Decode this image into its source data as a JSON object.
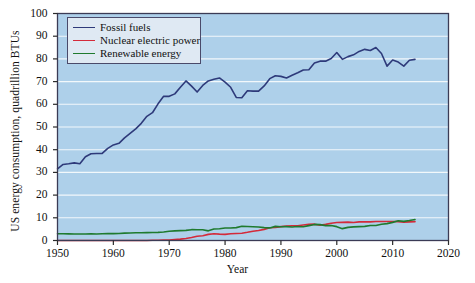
{
  "chart_data": {
    "type": "line",
    "title": "",
    "xlabel": "Year",
    "ylabel": "US energy consumption, quadrillion BTUs",
    "xlim": [
      1950,
      2020
    ],
    "ylim": [
      0,
      100
    ],
    "xticks": [
      1950,
      1960,
      1970,
      1980,
      1990,
      2000,
      2010,
      2020
    ],
    "yticks": [
      0,
      10,
      20,
      30,
      40,
      50,
      60,
      70,
      80,
      90,
      100
    ],
    "grid": "horizontal-white",
    "legend_position": "upper-left-inside",
    "plot_background": "#aed0ea",
    "x": [
      1950,
      1951,
      1952,
      1953,
      1954,
      1955,
      1956,
      1957,
      1958,
      1959,
      1960,
      1961,
      1962,
      1963,
      1964,
      1965,
      1966,
      1967,
      1968,
      1969,
      1970,
      1971,
      1972,
      1973,
      1974,
      1975,
      1976,
      1977,
      1978,
      1979,
      1980,
      1981,
      1982,
      1983,
      1984,
      1985,
      1986,
      1987,
      1988,
      1989,
      1990,
      1991,
      1992,
      1993,
      1994,
      1995,
      1996,
      1997,
      1998,
      1999,
      2000,
      2001,
      2002,
      2003,
      2004,
      2005,
      2006,
      2007,
      2008,
      2009,
      2010,
      2011,
      2012,
      2013,
      2014
    ],
    "series": [
      {
        "name": "Fossil fuels",
        "color": "#2e3a7a",
        "values": [
          31.6,
          33.5,
          33.8,
          34.2,
          33.8,
          36.9,
          38.2,
          38.3,
          38.4,
          40.6,
          42.1,
          42.8,
          45.2,
          47.2,
          49.2,
          51.6,
          54.7,
          56.3,
          60.2,
          63.5,
          63.5,
          64.6,
          67.5,
          70.3,
          68.0,
          65.4,
          68.3,
          70.3,
          71.0,
          71.6,
          69.8,
          67.5,
          63.0,
          62.9,
          66.0,
          65.8,
          65.8,
          68.1,
          71.3,
          72.6,
          72.3,
          71.6,
          72.8,
          73.9,
          75.1,
          75.2,
          78.2,
          79.0,
          79.0,
          80.2,
          82.8,
          79.8,
          81.0,
          81.8,
          83.3,
          84.2,
          83.7,
          85.0,
          82.4,
          76.8,
          79.5,
          78.6,
          76.8,
          79.4,
          79.8
        ]
      },
      {
        "name": "Nuclear electric power",
        "color": "#d42a3a",
        "values": [
          0.0,
          0.0,
          0.0,
          0.0,
          0.0,
          0.0,
          0.0,
          0.0,
          0.0,
          0.0,
          0.0,
          0.0,
          0.0,
          0.0,
          0.0,
          0.0,
          0.0,
          0.1,
          0.1,
          0.2,
          0.2,
          0.4,
          0.6,
          0.9,
          1.3,
          1.9,
          2.1,
          2.7,
          3.0,
          2.8,
          2.7,
          3.0,
          3.1,
          3.2,
          3.6,
          4.1,
          4.4,
          4.9,
          5.6,
          5.7,
          6.1,
          6.4,
          6.5,
          6.5,
          6.8,
          7.1,
          7.2,
          6.7,
          7.1,
          7.6,
          7.9,
          8.0,
          8.1,
          7.9,
          8.2,
          8.2,
          8.2,
          8.4,
          8.4,
          8.4,
          8.4,
          8.3,
          8.1,
          8.2,
          8.3
        ]
      },
      {
        "name": "Renewable energy",
        "color": "#1f7a2e",
        "values": [
          2.98,
          2.95,
          2.9,
          2.88,
          2.85,
          2.88,
          2.95,
          2.88,
          3.0,
          3.05,
          3.02,
          3.1,
          3.25,
          3.3,
          3.4,
          3.4,
          3.45,
          3.55,
          3.6,
          3.75,
          4.08,
          4.25,
          4.35,
          4.45,
          4.77,
          4.72,
          4.75,
          4.25,
          5.04,
          5.17,
          5.49,
          5.48,
          5.68,
          6.27,
          6.15,
          6.03,
          5.94,
          5.67,
          5.55,
          6.22,
          6.04,
          6.12,
          5.92,
          6.16,
          6.07,
          6.56,
          7.09,
          6.98,
          6.56,
          6.62,
          6.1,
          5.23,
          5.77,
          6.0,
          6.1,
          6.23,
          6.63,
          6.59,
          7.19,
          7.43,
          7.98,
          8.72,
          8.43,
          8.8,
          9.26
        ]
      }
    ]
  },
  "legend": {
    "entries": [
      {
        "label": "Fossil fuels"
      },
      {
        "label": "Nuclear electric power"
      },
      {
        "label": "Renewable energy"
      }
    ]
  },
  "axes": {
    "x_title": "Year",
    "y_title": "US energy consumption, quadrillion BTUs",
    "x_tick_labels": [
      "1950",
      "1960",
      "1970",
      "1980",
      "1990",
      "2000",
      "2010",
      "2020"
    ],
    "y_tick_labels": [
      "0",
      "10",
      "20",
      "30",
      "40",
      "50",
      "60",
      "70",
      "80",
      "90",
      "100"
    ]
  }
}
